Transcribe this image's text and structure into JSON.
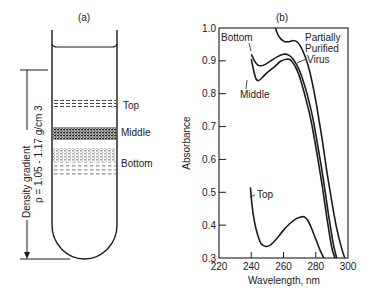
{
  "panel_a": {
    "label": "(a)",
    "bands": [
      {
        "name": "Top"
      },
      {
        "name": "Middle"
      },
      {
        "name": "Bottom"
      }
    ],
    "gradient_label_line1": "Density gradient",
    "gradient_label_line2": "ρ = 1.05 - 1.17 g/cm 3"
  },
  "panel_b": {
    "label": "(b)",
    "curve_labels": {
      "bottom": "Bottom",
      "middle": "Middle",
      "top": "Top",
      "virus_line1": "Partially",
      "virus_line2": "Purified",
      "virus_line3": "Virus"
    }
  },
  "chart_data": {
    "type": "line",
    "title": "(b)",
    "xlabel": "Wavelength, nm",
    "ylabel": "Absorbance",
    "xlim": [
      220,
      300
    ],
    "ylim": [
      0.3,
      1.0
    ],
    "xticks": [
      220,
      240,
      260,
      280,
      300
    ],
    "xtick_labels": [
      "220",
      "240",
      "260",
      "280",
      "300"
    ],
    "yticks": [
      0.3,
      0.4,
      0.5,
      0.6,
      0.7,
      0.8,
      0.9,
      1.0
    ],
    "ytick_labels": [
      "0.3",
      "0.4",
      "0.5",
      "0.6",
      "0.7",
      "0.8",
      "0.9",
      "1.0"
    ],
    "grid": false,
    "legend": "none (curves labeled directly)",
    "series": [
      {
        "name": "Partially Purified Virus",
        "x": [
          255,
          257,
          260,
          263,
          266,
          269,
          272,
          275,
          278,
          281,
          284,
          287,
          290,
          293,
          296,
          298
        ],
        "y": [
          1.0,
          0.975,
          0.96,
          0.958,
          0.962,
          0.955,
          0.93,
          0.89,
          0.83,
          0.75,
          0.66,
          0.56,
          0.47,
          0.39,
          0.33,
          0.3
        ]
      },
      {
        "name": "Bottom",
        "x": [
          240,
          242,
          244,
          246,
          249,
          252,
          256,
          260,
          263,
          266,
          270,
          274,
          278,
          282,
          285,
          288,
          291,
          293
        ],
        "y": [
          0.92,
          0.9,
          0.888,
          0.885,
          0.89,
          0.9,
          0.912,
          0.92,
          0.918,
          0.905,
          0.87,
          0.81,
          0.73,
          0.62,
          0.53,
          0.43,
          0.34,
          0.3
        ]
      },
      {
        "name": "Middle",
        "x": [
          240,
          241.5,
          243,
          244.5,
          247,
          250,
          254,
          258,
          262,
          265,
          269,
          273,
          277,
          281,
          284,
          287,
          290,
          292
        ],
        "y": [
          0.905,
          0.87,
          0.845,
          0.84,
          0.85,
          0.865,
          0.88,
          0.898,
          0.905,
          0.9,
          0.865,
          0.8,
          0.72,
          0.61,
          0.52,
          0.42,
          0.33,
          0.3
        ]
      },
      {
        "name": "Top",
        "x": [
          239.5,
          240.5,
          242,
          244,
          246,
          249,
          252,
          256,
          260,
          264,
          268,
          271,
          273,
          275,
          277,
          279,
          281,
          283,
          285
        ],
        "y": [
          0.515,
          0.46,
          0.41,
          0.37,
          0.345,
          0.335,
          0.34,
          0.36,
          0.385,
          0.405,
          0.42,
          0.425,
          0.425,
          0.415,
          0.395,
          0.37,
          0.345,
          0.32,
          0.3
        ]
      }
    ]
  }
}
